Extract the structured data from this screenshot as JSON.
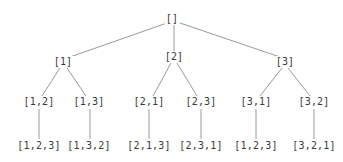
{
  "diagram": {
    "type": "tree",
    "title": "",
    "edge_color": "#9a9a9a",
    "text_color": "#3a3a3a",
    "nodes": [
      {
        "id": "root",
        "label": "[]",
        "x": 172,
        "y": 19
      },
      {
        "id": "n1",
        "label": "[1]",
        "x": 63,
        "y": 62
      },
      {
        "id": "n2",
        "label": "[2]",
        "x": 174,
        "y": 57
      },
      {
        "id": "n3",
        "label": "[3]",
        "x": 285,
        "y": 62
      },
      {
        "id": "n12",
        "label": "[1,2]",
        "x": 39,
        "y": 102
      },
      {
        "id": "n13",
        "label": "[1,3]",
        "x": 89,
        "y": 102
      },
      {
        "id": "n21",
        "label": "[2,1]",
        "x": 149,
        "y": 102
      },
      {
        "id": "n23",
        "label": "[2,3]",
        "x": 201,
        "y": 102
      },
      {
        "id": "n31",
        "label": "[3,1]",
        "x": 256,
        "y": 102
      },
      {
        "id": "n32",
        "label": "[3,2]",
        "x": 314,
        "y": 102
      },
      {
        "id": "n123",
        "label": "[1,2,3]",
        "x": 39,
        "y": 146
      },
      {
        "id": "n132",
        "label": "[1,3,2]",
        "x": 89,
        "y": 146
      },
      {
        "id": "n213",
        "label": "[2,1,3]",
        "x": 149,
        "y": 146
      },
      {
        "id": "n231",
        "label": "[2,3,1]",
        "x": 201,
        "y": 146
      },
      {
        "id": "n312",
        "label": "[1,2,3]",
        "x": 256,
        "y": 146
      },
      {
        "id": "n321",
        "label": "[3,2,1]",
        "x": 314,
        "y": 146
      }
    ],
    "edges": [
      {
        "from": "root",
        "to": "n1",
        "x1": 167,
        "y1": 23,
        "x2": 70,
        "y2": 57
      },
      {
        "from": "root",
        "to": "n2",
        "x1": 174,
        "y1": 25,
        "x2": 174,
        "y2": 51
      },
      {
        "from": "root",
        "to": "n3",
        "x1": 180,
        "y1": 23,
        "x2": 280,
        "y2": 57
      },
      {
        "from": "n1",
        "to": "n12",
        "x1": 60,
        "y1": 68,
        "x2": 42,
        "y2": 96
      },
      {
        "from": "n1",
        "to": "n13",
        "x1": 67,
        "y1": 68,
        "x2": 86,
        "y2": 96
      },
      {
        "from": "n2",
        "to": "n21",
        "x1": 171,
        "y1": 63,
        "x2": 153,
        "y2": 96
      },
      {
        "from": "n2",
        "to": "n23",
        "x1": 177,
        "y1": 63,
        "x2": 197,
        "y2": 96
      },
      {
        "from": "n3",
        "to": "n31",
        "x1": 282,
        "y1": 68,
        "x2": 260,
        "y2": 96
      },
      {
        "from": "n3",
        "to": "n32",
        "x1": 288,
        "y1": 68,
        "x2": 310,
        "y2": 96
      },
      {
        "from": "n12",
        "to": "n123",
        "x1": 39,
        "y1": 109,
        "x2": 39,
        "y2": 139
      },
      {
        "from": "n13",
        "to": "n132",
        "x1": 90,
        "y1": 109,
        "x2": 90,
        "y2": 139
      },
      {
        "from": "n21",
        "to": "n213",
        "x1": 149,
        "y1": 109,
        "x2": 149,
        "y2": 139
      },
      {
        "from": "n23",
        "to": "n231",
        "x1": 201,
        "y1": 109,
        "x2": 201,
        "y2": 139
      },
      {
        "from": "n31",
        "to": "n312",
        "x1": 256,
        "y1": 109,
        "x2": 256,
        "y2": 139
      },
      {
        "from": "n32",
        "to": "n321",
        "x1": 314,
        "y1": 109,
        "x2": 314,
        "y2": 139
      }
    ]
  }
}
